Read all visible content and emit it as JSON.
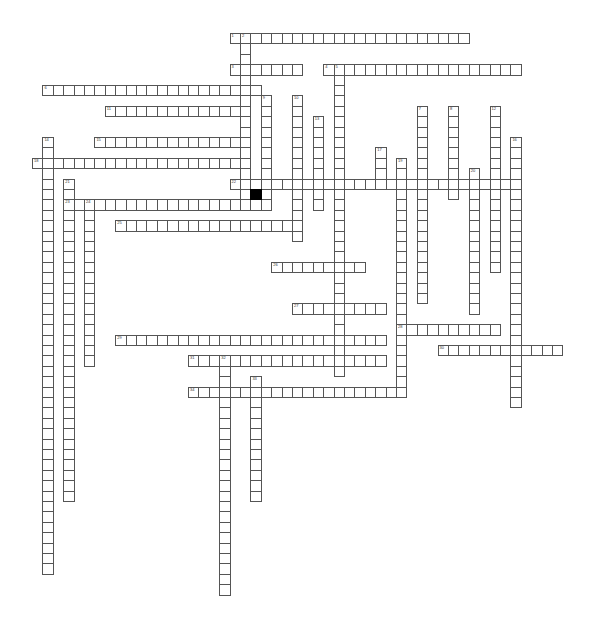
{
  "puzzle": {
    "type": "crossword",
    "grid": {
      "origin_x": 32,
      "origin_y": 33,
      "cell": 10.4
    },
    "colors": {
      "border": "#555555",
      "fill": "#ffffff",
      "block": "#000000"
    },
    "entries": [
      {
        "num": "1",
        "dir": "across",
        "r": 0,
        "c": 19,
        "len": 23
      },
      {
        "num": "2",
        "dir": "down",
        "r": 0,
        "c": 20,
        "len": 17
      },
      {
        "num": "3",
        "dir": "across",
        "r": 3,
        "c": 19,
        "len": 7
      },
      {
        "num": "4",
        "dir": "across",
        "r": 3,
        "c": 28,
        "len": 19
      },
      {
        "num": "5",
        "dir": "down",
        "r": 3,
        "c": 29,
        "len": 30
      },
      {
        "num": "6",
        "dir": "across",
        "r": 5,
        "c": 1,
        "len": 21
      },
      {
        "num": "7",
        "dir": "down",
        "r": 7,
        "c": 37,
        "len": 19
      },
      {
        "num": "8",
        "dir": "down",
        "r": 7,
        "c": 40,
        "len": 9
      },
      {
        "num": "9",
        "dir": "down",
        "r": 6,
        "c": 22,
        "len": 11
      },
      {
        "num": "10",
        "dir": "down",
        "r": 6,
        "c": 25,
        "len": 14
      },
      {
        "num": "11",
        "dir": "across",
        "r": 7,
        "c": 7,
        "len": 14
      },
      {
        "num": "12",
        "dir": "down",
        "r": 7,
        "c": 44,
        "len": 16
      },
      {
        "num": "13",
        "dir": "down",
        "r": 8,
        "c": 27,
        "len": 9
      },
      {
        "num": "14",
        "dir": "down",
        "r": 10,
        "c": 1,
        "len": 42
      },
      {
        "num": "15",
        "dir": "across",
        "r": 10,
        "c": 6,
        "len": 15
      },
      {
        "num": "16",
        "dir": "down",
        "r": 10,
        "c": 46,
        "len": 26
      },
      {
        "num": "17",
        "dir": "down",
        "r": 11,
        "c": 33,
        "len": 4
      },
      {
        "num": "18",
        "dir": "across",
        "r": 12,
        "c": 0,
        "len": 21
      },
      {
        "num": "19",
        "dir": "down",
        "r": 12,
        "c": 35,
        "len": 23
      },
      {
        "num": "20",
        "dir": "down",
        "r": 13,
        "c": 42,
        "len": 14
      },
      {
        "num": "21",
        "dir": "down",
        "r": 14,
        "c": 3,
        "len": 31
      },
      {
        "num": "22",
        "dir": "across",
        "r": 14,
        "c": 19,
        "len": 28
      },
      {
        "num": "23",
        "dir": "across",
        "r": 16,
        "c": 3,
        "len": 19
      },
      {
        "num": "24",
        "dir": "down",
        "r": 16,
        "c": 5,
        "len": 16
      },
      {
        "num": "25",
        "dir": "across",
        "r": 18,
        "c": 8,
        "len": 18
      },
      {
        "num": "26",
        "dir": "across",
        "r": 22,
        "c": 23,
        "len": 9
      },
      {
        "num": "27",
        "dir": "across",
        "r": 26,
        "c": 25,
        "len": 9
      },
      {
        "num": "28",
        "dir": "across",
        "r": 28,
        "c": 35,
        "len": 10
      },
      {
        "num": "29",
        "dir": "across",
        "r": 29,
        "c": 8,
        "len": 26
      },
      {
        "num": "30",
        "dir": "across",
        "r": 30,
        "c": 39,
        "len": 12
      },
      {
        "num": "31",
        "dir": "across",
        "r": 31,
        "c": 15,
        "len": 19
      },
      {
        "num": "32",
        "dir": "down",
        "r": 31,
        "c": 18,
        "len": 23
      },
      {
        "num": "33",
        "dir": "down",
        "r": 33,
        "c": 21,
        "len": 12
      },
      {
        "num": "34",
        "dir": "across",
        "r": 34,
        "c": 15,
        "len": 21
      }
    ],
    "blocks": [
      {
        "r": 15,
        "c": 21
      }
    ]
  }
}
